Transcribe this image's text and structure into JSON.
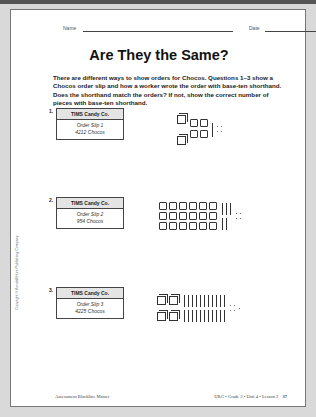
{
  "header": {
    "name_label": "Name",
    "date_label": "Date"
  },
  "title": "Are They the Same?",
  "intro": "There are different ways to show orders for Chocos. Questions 1–3 show a Chocos order slip and how a worker wrote the order with base-ten shorthand. Does the shorthand match the orders? If not, show the correct number of pieces with base-ten shorthand.",
  "questions": [
    {
      "number": "1.",
      "company": "TIMS Candy Co.",
      "slip": "Order Slip 1",
      "order": "4212 Chocos",
      "shorthand": {
        "packs": 2,
        "flats": 4,
        "sticks": 1,
        "bits": 4
      }
    },
    {
      "number": "2.",
      "company": "TIMS Candy Co.",
      "slip": "Order Slip 2",
      "order": "954 Chocos",
      "shorthand": {
        "packs": 0,
        "flats": 18,
        "sticks": 5,
        "bits": 4
      }
    },
    {
      "number": "3.",
      "company": "TIMS Candy Co.",
      "slip": "Order Slip 3",
      "order": "4225 Chocos",
      "shorthand": {
        "packs": 4,
        "flats": 0,
        "sticks": 22,
        "bits": 5
      }
    }
  ],
  "side_text": "Copyright © Kendall/Hunt Publishing Company",
  "footer": {
    "left": "Assessment Blackline Master",
    "right": "URG • Grade 3 • Unit 4 • Lesson 2",
    "page": "37"
  }
}
